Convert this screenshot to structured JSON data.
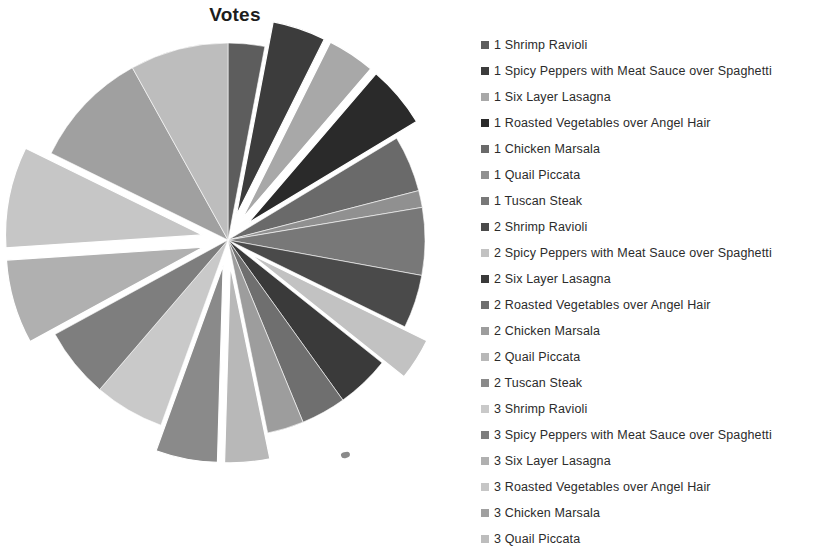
{
  "chart_data": {
    "type": "pie",
    "title": "Votes",
    "xlabel": "",
    "ylabel": "",
    "legend_position": "right",
    "grid": false,
    "start_angle_deg": 0,
    "direction": "clockwise",
    "categories": [
      "1 Shrimp Ravioli",
      "1 Spicy Peppers with Meat Sauce over  Spaghetti",
      "1 Six Layer Lasagna",
      "1 Roasted Vegetables over Angel Hair",
      "1 Chicken  Marsala",
      "1 Quail Piccata",
      "1 Tuscan Steak",
      "2 Shrimp Ravioli",
      "2 Spicy Peppers with Meat Sauce over  Spaghetti",
      "2 Six Layer Lasagna",
      "2 Roasted Vegetables over Angel Hair",
      "2 Chicken  Marsala",
      "2 Quail Piccata",
      "2 Tuscan Steak",
      "3 Shrimp Ravioli",
      "3 Spicy Peppers with Meat Sauce over  Spaghetti",
      "3 Six Layer Lasagna",
      "3 Roasted Vegetables over Angel Hair",
      "3 Chicken  Marsala",
      "3 Quail Piccata"
    ],
    "values": [
      13,
      19,
      17,
      22,
      20,
      6,
      24,
      19,
      15,
      19,
      16,
      13,
      16,
      22,
      25,
      25,
      30,
      36,
      42,
      35
    ],
    "colors": [
      "#5d5d5d",
      "#3c3c3c",
      "#a8a8a8",
      "#2a2a2a",
      "#6a6a6a",
      "#909090",
      "#787878",
      "#4a4a4a",
      "#c2c2c2",
      "#3a3a3a",
      "#6f6f6f",
      "#9d9d9d",
      "#b8b8b8",
      "#8a8a8a",
      "#c9c9c9",
      "#7e7e7e",
      "#b0b0b0",
      "#c6c6c6",
      "#a0a0a0",
      "#bdbdbd"
    ],
    "exploded": [
      false,
      true,
      true,
      true,
      false,
      false,
      false,
      false,
      true,
      false,
      false,
      false,
      true,
      true,
      false,
      false,
      true,
      true,
      false,
      false
    ]
  },
  "legend": {
    "items": [
      {
        "label": "1 Shrimp Ravioli",
        "color": "#5d5d5d"
      },
      {
        "label": "1 Spicy Peppers with Meat Sauce over  Spaghetti",
        "color": "#3c3c3c"
      },
      {
        "label": "1 Six Layer Lasagna",
        "color": "#a8a8a8"
      },
      {
        "label": "1 Roasted Vegetables over Angel Hair",
        "color": "#2a2a2a"
      },
      {
        "label": "1 Chicken  Marsala",
        "color": "#6a6a6a"
      },
      {
        "label": "1 Quail Piccata",
        "color": "#909090"
      },
      {
        "label": "1 Tuscan Steak",
        "color": "#787878"
      },
      {
        "label": "2 Shrimp Ravioli",
        "color": "#4a4a4a"
      },
      {
        "label": "2 Spicy Peppers with Meat Sauce over  Spaghetti",
        "color": "#c2c2c2"
      },
      {
        "label": "2 Six Layer Lasagna",
        "color": "#3a3a3a"
      },
      {
        "label": "2 Roasted Vegetables over Angel Hair",
        "color": "#6f6f6f"
      },
      {
        "label": "2 Chicken  Marsala",
        "color": "#9d9d9d"
      },
      {
        "label": "2 Quail Piccata",
        "color": "#b8b8b8"
      },
      {
        "label": "2 Tuscan Steak",
        "color": "#8a8a8a"
      },
      {
        "label": "3 Shrimp Ravioli",
        "color": "#c9c9c9"
      },
      {
        "label": "3 Spicy Peppers with Meat Sauce over  Spaghetti",
        "color": "#7e7e7e"
      },
      {
        "label": "3 Six Layer Lasagna",
        "color": "#b0b0b0"
      },
      {
        "label": "3 Roasted Vegetables over Angel Hair",
        "color": "#c6c6c6"
      },
      {
        "label": "3 Chicken  Marsala",
        "color": "#a0a0a0"
      },
      {
        "label": "3 Quail Piccata",
        "color": "#bdbdbd"
      }
    ]
  }
}
